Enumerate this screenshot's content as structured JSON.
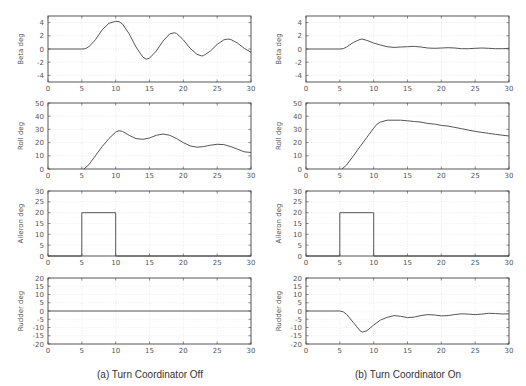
{
  "figure": {
    "captions": [
      "(a) Turn Coordinator Off",
      "(b) Turn Coordinator On"
    ],
    "colors": {
      "line": "#555555",
      "axis": "#444444",
      "grid": "#d8d8d8",
      "text": "#555555"
    }
  },
  "chart_data": [
    {
      "type": "line",
      "panel": "a",
      "title": "",
      "xlabel": "",
      "ylabel": "Beta deg",
      "xlim": [
        0,
        30
      ],
      "ylim": [
        -5,
        5
      ],
      "xticks": [
        0,
        5,
        10,
        15,
        20,
        25,
        30
      ],
      "yticks": [
        -4,
        -2,
        0,
        2,
        4
      ],
      "grid": true,
      "x": [
        0,
        5,
        5.5,
        6,
        7,
        8,
        9,
        10,
        10.5,
        11,
        12,
        13,
        14,
        14.5,
        15,
        16,
        17,
        18,
        18.7,
        19,
        20,
        21,
        22,
        22.7,
        23,
        24,
        25,
        26,
        26.5,
        27,
        28,
        29,
        30
      ],
      "values": [
        0,
        0,
        0.05,
        0.3,
        1.4,
        2.9,
        3.9,
        4.2,
        4.15,
        3.8,
        2.3,
        0.3,
        -1.2,
        -1.55,
        -1.4,
        -0.3,
        1.2,
        2.3,
        2.45,
        2.35,
        1.4,
        0.1,
        -0.8,
        -1.05,
        -1.0,
        -0.3,
        0.7,
        1.4,
        1.5,
        1.45,
        0.9,
        0.1,
        -0.5
      ]
    },
    {
      "type": "line",
      "panel": "a",
      "ylabel": "Roll deg",
      "xlim": [
        0,
        30
      ],
      "ylim": [
        0,
        50
      ],
      "xticks": [
        0,
        5,
        10,
        15,
        20,
        25,
        30
      ],
      "yticks": [
        0,
        10,
        20,
        30,
        40,
        50
      ],
      "grid": true,
      "x": [
        5.3,
        6,
        7,
        8,
        9,
        10,
        10.5,
        11,
        12,
        13,
        14,
        15,
        16,
        17,
        18,
        19,
        20,
        21,
        22,
        23,
        24,
        25,
        26,
        27,
        28,
        29,
        30
      ],
      "values": [
        0,
        3,
        10,
        17,
        23,
        28,
        29,
        28.5,
        25.5,
        23,
        22.5,
        23.5,
        25.5,
        26.5,
        25.5,
        23,
        20,
        17.5,
        16.5,
        17,
        18,
        18.7,
        18.5,
        17,
        15,
        13,
        12.5
      ]
    },
    {
      "type": "line",
      "panel": "a",
      "ylabel": "Aileron deg",
      "xlim": [
        0,
        30
      ],
      "ylim": [
        0,
        30
      ],
      "xticks": [
        0,
        5,
        10,
        15,
        20,
        25,
        30
      ],
      "yticks": [
        0,
        5,
        10,
        15,
        20,
        25,
        30
      ],
      "grid": true,
      "x": [
        0,
        5,
        5,
        10,
        10,
        30
      ],
      "values": [
        0,
        0,
        20,
        20,
        0,
        0
      ]
    },
    {
      "type": "line",
      "panel": "a",
      "ylabel": "Rudder deg",
      "xlim": [
        0,
        30
      ],
      "ylim": [
        -20,
        20
      ],
      "xticks": [
        0,
        5,
        10,
        15,
        20,
        25,
        30
      ],
      "yticks": [
        -20,
        -15,
        -10,
        -5,
        0,
        5,
        10,
        15,
        20
      ],
      "grid": true,
      "x": [
        0,
        30
      ],
      "values": [
        0,
        0
      ]
    },
    {
      "type": "line",
      "panel": "b",
      "ylabel": "Beta deg",
      "xlim": [
        0,
        30
      ],
      "ylim": [
        -5,
        5
      ],
      "xticks": [
        0,
        5,
        10,
        15,
        20,
        25,
        30
      ],
      "yticks": [
        -4,
        -2,
        0,
        2,
        4
      ],
      "grid": true,
      "x": [
        0,
        5,
        5.5,
        6,
        7,
        8,
        8.3,
        9,
        10,
        11,
        12,
        13,
        14,
        15,
        16,
        17,
        18,
        19,
        20,
        21,
        22,
        23,
        24,
        25,
        26,
        27,
        28,
        29,
        30
      ],
      "values": [
        0,
        0,
        0.05,
        0.3,
        1.0,
        1.45,
        1.5,
        1.3,
        0.9,
        0.6,
        0.35,
        0.25,
        0.3,
        0.35,
        0.4,
        0.3,
        0.15,
        0.1,
        0.15,
        0.2,
        0.15,
        0.05,
        0.05,
        0.1,
        0.15,
        0.1,
        0.05,
        0.05,
        0.1
      ]
    },
    {
      "type": "line",
      "panel": "b",
      "ylabel": "Roll deg",
      "xlim": [
        0,
        30
      ],
      "ylim": [
        0,
        50
      ],
      "xticks": [
        0,
        5,
        10,
        15,
        20,
        25,
        30
      ],
      "yticks": [
        0,
        10,
        20,
        30,
        40,
        50
      ],
      "grid": true,
      "x": [
        5.3,
        6,
        7,
        8,
        9,
        10,
        10.5,
        11,
        12,
        13,
        14,
        15,
        16,
        17,
        18,
        19,
        20,
        21,
        22,
        23,
        24,
        25,
        26,
        27,
        28,
        29,
        30
      ],
      "values": [
        0,
        3,
        10,
        17,
        24,
        31,
        34,
        35.5,
        37,
        37,
        37,
        36.5,
        36,
        35.5,
        34.5,
        34,
        33,
        32.5,
        31.5,
        30.5,
        29.5,
        28.5,
        27.7,
        27,
        26.3,
        25.6,
        25
      ]
    },
    {
      "type": "line",
      "panel": "b",
      "ylabel": "Aileron deg",
      "xlim": [
        0,
        30
      ],
      "ylim": [
        0,
        30
      ],
      "xticks": [
        0,
        5,
        10,
        15,
        20,
        25,
        30
      ],
      "yticks": [
        0,
        5,
        10,
        15,
        20,
        25,
        30
      ],
      "grid": true,
      "x": [
        0,
        5,
        5,
        10,
        10,
        30
      ],
      "values": [
        0,
        0,
        20,
        20,
        0,
        0
      ]
    },
    {
      "type": "line",
      "panel": "b",
      "ylabel": "Rudder deg",
      "xlim": [
        0,
        30
      ],
      "ylim": [
        -20,
        20
      ],
      "xticks": [
        0,
        5,
        10,
        15,
        20,
        25,
        30
      ],
      "yticks": [
        -20,
        -15,
        -10,
        -5,
        0,
        5,
        10,
        15,
        20
      ],
      "grid": true,
      "x": [
        0,
        5,
        5.5,
        6,
        7,
        8,
        8.3,
        9,
        10,
        11,
        12,
        13,
        14,
        15,
        16,
        17,
        18,
        19,
        20,
        21,
        22,
        23,
        24,
        25,
        26,
        27,
        28,
        29,
        30
      ],
      "values": [
        0,
        0,
        -0.5,
        -2,
        -7,
        -12,
        -12.8,
        -12,
        -8.5,
        -5.5,
        -3.8,
        -2.8,
        -3.2,
        -4,
        -3.7,
        -2.7,
        -2.2,
        -2.4,
        -3.0,
        -2.8,
        -2.1,
        -1.7,
        -1.9,
        -2.2,
        -1.9,
        -1.4,
        -1.5,
        -1.8,
        -1.7
      ]
    }
  ]
}
